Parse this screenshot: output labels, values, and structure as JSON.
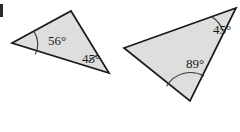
{
  "figure": {
    "background_color": "#ffffff",
    "fill_color": "#dededd",
    "stroke_color": "#1a1a1a",
    "arc_color": "#3a3a3a",
    "label_color": "#1a1a1a",
    "corner_mark": {
      "label": "figure-label-fragment",
      "color": "#2b2b2b"
    },
    "triangles": [
      {
        "id": "triangle-left",
        "name": "left-triangle",
        "vertices": [
          {
            "name": "left-vertex",
            "x": 12,
            "y": 43
          },
          {
            "name": "top-vertex",
            "x": 71,
            "y": 11
          },
          {
            "name": "bottom-right-vertex",
            "x": 109,
            "y": 73
          }
        ],
        "angles": [
          {
            "name": "angle-56",
            "value": "56°",
            "at_vertex": "left-vertex",
            "label_x": 48,
            "label_y": 42,
            "arc_radius": 24
          },
          {
            "name": "angle-45",
            "value": "45°",
            "at_vertex": "bottom-right-vertex",
            "label_x": 82,
            "label_y": 60,
            "arc_radius": 21
          }
        ]
      },
      {
        "id": "triangle-right",
        "name": "right-triangle",
        "vertices": [
          {
            "name": "left-vertex",
            "x": 124,
            "y": 48
          },
          {
            "name": "top-right-vertex",
            "x": 236,
            "y": 8
          },
          {
            "name": "bottom-vertex",
            "x": 190,
            "y": 101
          }
        ],
        "angles": [
          {
            "name": "angle-45",
            "value": "45°",
            "at_vertex": "top-right-vertex",
            "label_x": 213,
            "label_y": 31,
            "arc_radius": 26
          },
          {
            "name": "angle-89",
            "value": "89°",
            "at_vertex": "bottom-vertex",
            "label_x": 186,
            "label_y": 65,
            "arc_radius": 28
          }
        ]
      }
    ]
  }
}
